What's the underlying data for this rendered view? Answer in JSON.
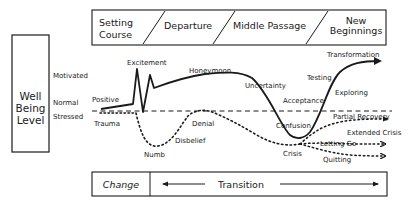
{
  "y_axis_box": {
    "lines": [
      "Well",
      "Being",
      "Level"
    ]
  },
  "levels": [
    {
      "key": "motivated",
      "label": "Motivated"
    },
    {
      "key": "normal",
      "label": "Normal"
    },
    {
      "key": "stressed",
      "label": "Stressed"
    }
  ],
  "phases_header": [
    {
      "lines": [
        "Setting",
        "Course"
      ]
    },
    {
      "lines": [
        "Departure"
      ]
    },
    {
      "lines": [
        "Middle Passage"
      ]
    },
    {
      "lines": [
        "New",
        "Beginnings"
      ]
    }
  ],
  "bottom_bar": {
    "change_label": "Change",
    "transition_label": "Transition"
  },
  "positive_path": {
    "style": "solid",
    "labels": [
      "Positive",
      "Excitement",
      "Honeymoon",
      "Uncertainty",
      "Confusion",
      "Acceptance",
      "Testing",
      "Exploring",
      "Transformation"
    ]
  },
  "negative_path": {
    "style": "dotted",
    "labels": [
      "Trauma",
      "Numb",
      "Disbelief",
      "Denial",
      "Crisis"
    ]
  },
  "outcomes": [
    {
      "label": "Partial Recovery"
    },
    {
      "label": "Extended Crisis"
    },
    {
      "label": "Letting Go"
    },
    {
      "label": "Quitting"
    }
  ],
  "colors": {
    "ink": "#1a1a1a",
    "background": "#ffffff"
  }
}
